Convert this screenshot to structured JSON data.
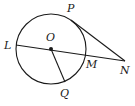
{
  "diagram": {
    "type": "geometry",
    "colors": {
      "stroke": "#1a1a1a",
      "background": "#ffffff"
    },
    "circle": {
      "center_label": "O",
      "cx": 51,
      "cy": 49,
      "r": 35
    },
    "points": {
      "P": {
        "label": "P",
        "x": 71,
        "y": 20,
        "label_x": 67,
        "label_y": 12
      },
      "L": {
        "label": "L",
        "x": 16,
        "y": 45,
        "label_x": 4,
        "label_y": 49
      },
      "O": {
        "label": "O",
        "x": 51,
        "y": 49,
        "label_x": 46,
        "label_y": 41
      },
      "M": {
        "label": "M",
        "x": 86,
        "y": 55,
        "label_x": 86,
        "label_y": 68
      },
      "N": {
        "label": "N",
        "x": 125,
        "y": 61,
        "label_x": 120,
        "label_y": 74
      },
      "Q": {
        "label": "Q",
        "x": 65,
        "y": 82,
        "label_x": 60,
        "label_y": 97
      }
    },
    "segments": [
      {
        "name": "secant-LN",
        "from": "L",
        "to": "N"
      },
      {
        "name": "tangent-PN",
        "from": "P",
        "to": "N"
      },
      {
        "name": "radius-OQ",
        "from": "O",
        "to": "Q"
      }
    ]
  }
}
